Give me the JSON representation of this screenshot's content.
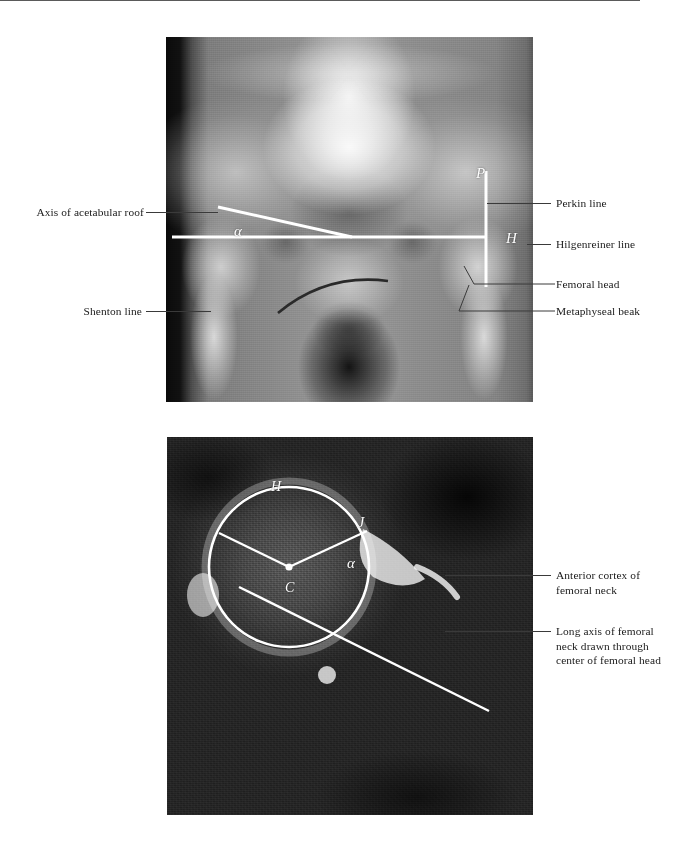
{
  "figure": {
    "panels": [
      {
        "id": "ap-pelvis-radiograph",
        "modality": "AP pelvis radiograph",
        "markers": [
          {
            "name": "perkin-line-marker",
            "text": "P"
          },
          {
            "name": "hilgenreiner-line-marker",
            "text": "H"
          },
          {
            "name": "acetabular-angle-marker",
            "text": "α"
          }
        ],
        "labels": [
          {
            "name": "label-axis-of-acetabular-roof",
            "text": "Axis of acetabular roof",
            "side": "left"
          },
          {
            "name": "label-shenton-line",
            "text": "Shenton line",
            "side": "left"
          },
          {
            "name": "label-perkin-line",
            "text": "Perkin line",
            "side": "right"
          },
          {
            "name": "label-hilgenreiner-line",
            "text": "Hilgenreiner line",
            "side": "right"
          },
          {
            "name": "label-femoral-head",
            "text": "Femoral head",
            "side": "right"
          },
          {
            "name": "label-metaphyseal-beak",
            "text": "Metaphyseal beak",
            "side": "right"
          }
        ]
      },
      {
        "id": "axial-ct-femoral-neck",
        "modality": "Axial CT of the hip",
        "markers": [
          {
            "name": "femoral-head-circle-marker",
            "text": "H"
          },
          {
            "name": "center-of-head-marker",
            "text": "C"
          },
          {
            "name": "junction-point-marker",
            "text": "J"
          },
          {
            "name": "alpha-angle-marker",
            "text": "α"
          }
        ],
        "labels": [
          {
            "name": "label-anterior-cortex-of-femoral-neck",
            "text": "Anterior cortex of\nfemoral neck",
            "side": "right"
          },
          {
            "name": "label-long-axis-of-femoral-neck",
            "text": "Long axis of femoral\nneck drawn through\ncenter of femoral head",
            "side": "right"
          }
        ]
      }
    ]
  },
  "style": {
    "overlay_line_color": "#ffffff",
    "leader_line_color": "#3a3a3a",
    "label_text_color": "#1a1a1a",
    "page_background": "#ffffff"
  }
}
